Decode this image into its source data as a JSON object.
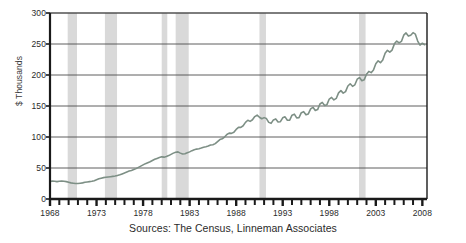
{
  "caption": "Sources: The Census, Linneman Associates",
  "colors": {
    "line": "#7d8f85",
    "recession_band": "#d9d9d9",
    "gridline": "#4d4d4d",
    "axis": "#1a1a1a",
    "text": "#2b2b2b"
  },
  "chart_data": {
    "type": "line",
    "title": "",
    "subtitle": "",
    "xlabel": "",
    "ylabel": "$ Thousands",
    "xlim": [
      1968,
      2008.5
    ],
    "ylim": [
      0,
      300
    ],
    "grid": true,
    "legend_position": "none",
    "yticks": [
      0,
      50,
      100,
      150,
      200,
      250,
      300
    ],
    "xticks": [
      1968,
      1973,
      1978,
      1983,
      1988,
      1993,
      1998,
      2003,
      2008
    ],
    "xtick_minor_step": 1,
    "annotations": [
      {
        "type": "shaded_band",
        "label": "recession",
        "x0": 1969.9,
        "x1": 1970.9
      },
      {
        "type": "shaded_band",
        "label": "recession",
        "x0": 1973.9,
        "x1": 1975.2
      },
      {
        "type": "shaded_band",
        "label": "recession",
        "x0": 1980.0,
        "x1": 1980.6
      },
      {
        "type": "shaded_band",
        "label": "recession",
        "x0": 1981.5,
        "x1": 1982.9
      },
      {
        "type": "shaded_band",
        "label": "recession",
        "x0": 1990.5,
        "x1": 1991.2
      },
      {
        "type": "shaded_band",
        "label": "recession",
        "x0": 2001.2,
        "x1": 2001.9
      }
    ],
    "series": [
      {
        "name": "Home Price",
        "x": [
          1968.0,
          1968.25,
          1968.5,
          1968.75,
          1969.0,
          1969.25,
          1969.5,
          1969.75,
          1970.0,
          1970.25,
          1970.5,
          1970.75,
          1971.0,
          1971.25,
          1971.5,
          1971.75,
          1972.0,
          1972.25,
          1972.5,
          1972.75,
          1973.0,
          1973.25,
          1973.5,
          1973.75,
          1974.0,
          1974.25,
          1974.5,
          1974.75,
          1975.0,
          1975.25,
          1975.5,
          1975.75,
          1976.0,
          1976.25,
          1976.5,
          1976.75,
          1977.0,
          1977.25,
          1977.5,
          1977.75,
          1978.0,
          1978.25,
          1978.5,
          1978.75,
          1979.0,
          1979.25,
          1979.5,
          1979.75,
          1980.0,
          1980.25,
          1980.5,
          1980.75,
          1981.0,
          1981.25,
          1981.5,
          1981.75,
          1982.0,
          1982.25,
          1982.5,
          1982.75,
          1983.0,
          1983.25,
          1983.5,
          1983.75,
          1984.0,
          1984.25,
          1984.5,
          1984.75,
          1985.0,
          1985.25,
          1985.5,
          1985.75,
          1986.0,
          1986.25,
          1986.5,
          1986.75,
          1987.0,
          1987.25,
          1987.5,
          1987.75,
          1988.0,
          1988.25,
          1988.5,
          1988.75,
          1989.0,
          1989.25,
          1989.5,
          1989.75,
          1990.0,
          1990.25,
          1990.5,
          1990.75,
          1991.0,
          1991.25,
          1991.5,
          1991.75,
          1992.0,
          1992.25,
          1992.5,
          1992.75,
          1993.0,
          1993.25,
          1993.5,
          1993.75,
          1994.0,
          1994.25,
          1994.5,
          1994.75,
          1995.0,
          1995.25,
          1995.5,
          1995.75,
          1996.0,
          1996.25,
          1996.5,
          1996.75,
          1997.0,
          1997.25,
          1997.5,
          1997.75,
          1998.0,
          1998.25,
          1998.5,
          1998.75,
          1999.0,
          1999.25,
          1999.5,
          1999.75,
          2000.0,
          2000.25,
          2000.5,
          2000.75,
          2001.0,
          2001.25,
          2001.5,
          2001.75,
          2002.0,
          2002.25,
          2002.5,
          2002.75,
          2003.0,
          2003.25,
          2003.5,
          2003.75,
          2004.0,
          2004.25,
          2004.5,
          2004.75,
          2005.0,
          2005.25,
          2005.5,
          2005.75,
          2006.0,
          2006.25,
          2006.5,
          2006.75,
          2007.0,
          2007.25,
          2007.5,
          2007.75,
          2008.0,
          2008.25
        ],
        "y": [
          28,
          29,
          28.5,
          28,
          28.5,
          29,
          28.5,
          28,
          27,
          26,
          25.5,
          25,
          25,
          25.5,
          26,
          27,
          27.5,
          28,
          28.5,
          29.5,
          31,
          32.5,
          33.5,
          34.5,
          35,
          35.5,
          36,
          36.5,
          37,
          38,
          39,
          40.5,
          42,
          43.5,
          45,
          46,
          47.5,
          49,
          51,
          53,
          55,
          57,
          58.5,
          60,
          62,
          64,
          65.5,
          67,
          68,
          67.5,
          68.5,
          70,
          72,
          74,
          75.5,
          76,
          74,
          72.5,
          73,
          74.5,
          76,
          78,
          79.5,
          80.5,
          81,
          82,
          83.5,
          84.5,
          85,
          86.5,
          88,
          90,
          92,
          95,
          98,
          101,
          103,
          105,
          107,
          109,
          111,
          114,
          117,
          120,
          122,
          125,
          127,
          130,
          131,
          133,
          134,
          132,
          129,
          127,
          126,
          125,
          125,
          126,
          127,
          128,
          128,
          129,
          130,
          131,
          132,
          133,
          134,
          135,
          136,
          137,
          139,
          141,
          142,
          144,
          146,
          148,
          150,
          152,
          154,
          156,
          158,
          160,
          163,
          166,
          168,
          171,
          174,
          177,
          179,
          182,
          185,
          188,
          190,
          192,
          194,
          196,
          198,
          202,
          207,
          212,
          215,
          219,
          223,
          228,
          232,
          236,
          240,
          244,
          247,
          251,
          255,
          258,
          261,
          264,
          266,
          268,
          265,
          262,
          258,
          252,
          248,
          245
        ],
        "seasonal_amplitude": 5,
        "color": "#7d8f85",
        "line_width": 1.6,
        "units": "$ thousands"
      }
    ]
  }
}
